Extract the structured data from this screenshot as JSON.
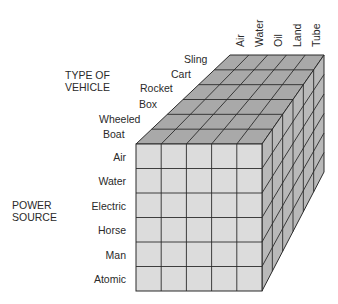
{
  "diagram": {
    "type": "morphological-box",
    "axes": {
      "type_of_vehicle": {
        "title_line1": "TYPE OF",
        "title_line2": "VEHICLE",
        "values": [
          "Boat",
          "Wheeled",
          "Box",
          "Rocket",
          "Cart",
          "Sling"
        ]
      },
      "power_source": {
        "title_line1": "POWER",
        "title_line2": "SOURCE",
        "values": [
          "Air",
          "Water",
          "Electric",
          "Horse",
          "Man",
          "Atomic"
        ]
      },
      "medium": {
        "values": [
          "Air",
          "Water",
          "Oil",
          "Land",
          "Tube"
        ]
      }
    },
    "colors": {
      "front_face": "#dcdcdc",
      "top_face": "#a9a9a9",
      "side_face": "#b9b9b9",
      "grid_line": "#2b2b2b"
    }
  }
}
